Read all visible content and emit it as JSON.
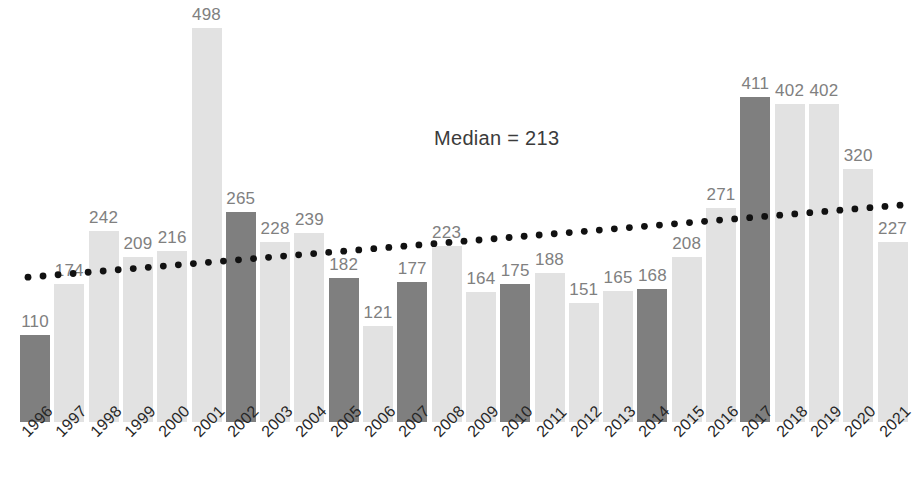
{
  "chart_data": {
    "type": "bar",
    "title": "",
    "subtitle": "",
    "xlabel": "",
    "ylabel": "",
    "ylim": [
      0,
      498
    ],
    "grid": false,
    "legend": null,
    "categories": [
      "1996",
      "1997",
      "1998",
      "1999",
      "2000",
      "2001",
      "2002",
      "2003",
      "2004",
      "2005",
      "2006",
      "2007",
      "2008",
      "2009",
      "2010",
      "2011",
      "2012",
      "2013",
      "2014",
      "2015",
      "2016",
      "2017",
      "2018",
      "2019",
      "2020",
      "2021"
    ],
    "values": [
      110,
      174,
      242,
      209,
      216,
      498,
      265,
      228,
      239,
      182,
      121,
      177,
      223,
      164,
      175,
      188,
      151,
      165,
      168,
      208,
      271,
      411,
      402,
      402,
      320,
      227
    ],
    "bar_styles": [
      "dark",
      "light",
      "light",
      "light",
      "light",
      "light",
      "dark",
      "light",
      "light",
      "dark",
      "light",
      "dark",
      "light",
      "light",
      "dark",
      "light",
      "light",
      "light",
      "dark",
      "light",
      "light",
      "dark",
      "light",
      "light",
      "light",
      "light"
    ],
    "colors": {
      "bar_light": "#e2e2e2",
      "bar_dark": "#7f7f7f",
      "data_label": "#808080",
      "tick_label": "#262626",
      "annotation": "#3b3b3b",
      "trendline": "#111111",
      "background": "#ffffff"
    },
    "annotations": [
      {
        "name": "median-annotation",
        "text": "Median = 213",
        "value": 213
      }
    ],
    "trendline": {
      "style": "dotted",
      "start": {
        "x": 28,
        "y_value": 183
      },
      "end": {
        "x": 900,
        "y_value": 274
      }
    }
  }
}
